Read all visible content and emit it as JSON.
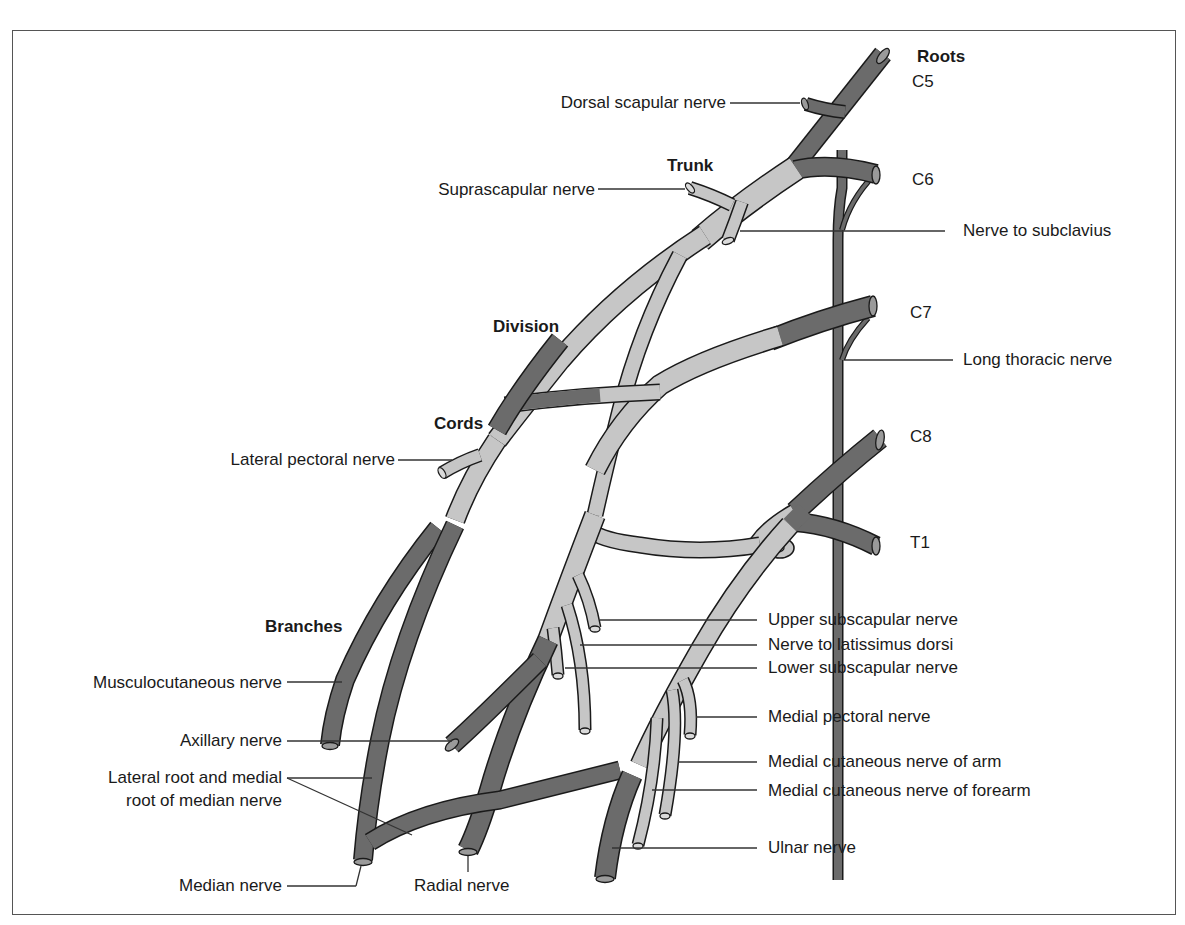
{
  "colors": {
    "root_cord_branch": "#6b6b6b",
    "trunk_division": "#c6c6c6",
    "outline": "#1a1a1a",
    "frame": "#555555"
  },
  "section_labels": {
    "roots": "Roots",
    "trunk": "Trunk",
    "division": "Division",
    "cords": "Cords",
    "branches": "Branches"
  },
  "roots": {
    "c5": "C5",
    "c6": "C6",
    "c7": "C7",
    "c8": "C8",
    "t1": "T1"
  },
  "labels_left": {
    "dorsal_scapular": "Dorsal scapular nerve",
    "suprascapular": "Suprascapular nerve",
    "lateral_pectoral": "Lateral pectoral nerve",
    "musculocutaneous": "Musculocutaneous nerve",
    "axillary": "Axillary nerve",
    "lateral_medial_root_line1": "Lateral root and medial",
    "lateral_medial_root_line2": "root of median nerve",
    "median": "Median nerve",
    "radial": "Radial nerve"
  },
  "labels_right": {
    "nerve_to_subclavius": "Nerve to subclavius",
    "long_thoracic": "Long thoracic nerve",
    "upper_subscapular": "Upper subscapular nerve",
    "latissimus_dorsi": "Nerve to latissimus dorsi",
    "lower_subscapular": "Lower subscapular nerve",
    "medial_pectoral": "Medial pectoral nerve",
    "medial_cutaneous_arm": "Medial cutaneous nerve of arm",
    "medial_cutaneous_forearm": "Medial cutaneous nerve of forearm",
    "ulnar": "Ulnar nerve"
  }
}
